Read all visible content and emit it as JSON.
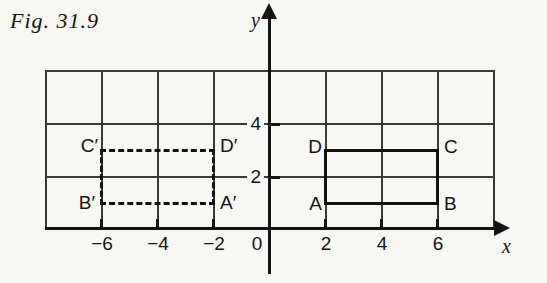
{
  "figure_label": "Fig. 31.9",
  "axes": {
    "x_label": "x",
    "y_label": "y",
    "origin_label": "0",
    "x_tick_labels": [
      "−6",
      "−4",
      "−2",
      "2",
      "4",
      "6"
    ],
    "y_tick_labels": [
      "4",
      "2"
    ]
  },
  "grid": {
    "x_range": [
      -8,
      8
    ],
    "y_range": [
      0,
      6
    ],
    "cell_size": 2
  },
  "shapes": {
    "solid_rectangle": {
      "style": "solid",
      "vertices": [
        {
          "label": "A",
          "x": 2,
          "y": 1
        },
        {
          "label": "B",
          "x": 6,
          "y": 1
        },
        {
          "label": "C",
          "x": 6,
          "y": 3
        },
        {
          "label": "D",
          "x": 2,
          "y": 3
        }
      ]
    },
    "dashed_rectangle": {
      "style": "dashed",
      "vertices": [
        {
          "label": "A′",
          "x": -2,
          "y": 1
        },
        {
          "label": "B′",
          "x": -6,
          "y": 1
        },
        {
          "label": "C′",
          "x": -6,
          "y": 3
        },
        {
          "label": "D′",
          "x": -2,
          "y": 3
        }
      ]
    }
  },
  "colors": {
    "ink": "#141414",
    "gridline": "#3a3a3a",
    "paper": "#f7f7f4"
  }
}
